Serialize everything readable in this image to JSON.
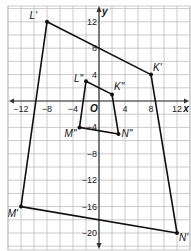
{
  "diagram": {
    "type": "coordinate-plane",
    "colors": {
      "grid": "#bdbdbd",
      "axis": "#333333",
      "figure": "#111111",
      "background": "#ffffff"
    },
    "x_range": [
      -14,
      14
    ],
    "y_range": [
      -22,
      14
    ],
    "grid_step": 2,
    "axis_labels": {
      "x": "x",
      "y": "y",
      "origin": "O"
    },
    "x_ticks": [
      {
        "value": -12,
        "label": "−12"
      },
      {
        "value": -8,
        "label": "−8"
      },
      {
        "value": -4,
        "label": "−4"
      },
      {
        "value": 4,
        "label": "4"
      },
      {
        "value": 8,
        "label": "8"
      },
      {
        "value": 12,
        "label": "12"
      }
    ],
    "y_ticks": [
      {
        "value": 12,
        "label": "12"
      },
      {
        "value": 8,
        "label": "8"
      },
      {
        "value": 4,
        "label": "4"
      },
      {
        "value": -4,
        "label": "−4"
      },
      {
        "value": -8,
        "label": "−8"
      },
      {
        "value": -12,
        "label": "−12"
      },
      {
        "value": -16,
        "label": "−16"
      },
      {
        "value": -20,
        "label": "−20"
      }
    ],
    "polygons": [
      {
        "name": "K'L'M'N'",
        "vertices": [
          {
            "label": "L'",
            "x": -8,
            "y": 12,
            "label_pos": "top-left"
          },
          {
            "label": "K'",
            "x": 8,
            "y": 4,
            "label_pos": "top-right"
          },
          {
            "label": "N'",
            "x": 12,
            "y": -20,
            "label_pos": "bottom-right"
          },
          {
            "label": "M'",
            "x": -12,
            "y": -16,
            "label_pos": "bottom-left"
          }
        ]
      },
      {
        "name": "K''L''M''N''",
        "vertices": [
          {
            "label": "L\"",
            "x": -2,
            "y": 3,
            "label_pos": "left"
          },
          {
            "label": "K\"",
            "x": 2,
            "y": 1,
            "label_pos": "top-right"
          },
          {
            "label": "N\"",
            "x": 3,
            "y": -5,
            "label_pos": "right"
          },
          {
            "label": "M\"",
            "x": -3,
            "y": -4,
            "label_pos": "bottom-left"
          }
        ]
      }
    ]
  }
}
